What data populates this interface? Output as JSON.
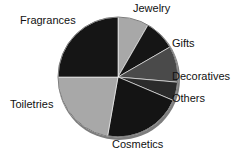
{
  "chart_data": {
    "type": "pie",
    "title": "",
    "categories": [
      "Jewelry",
      "Gifts",
      "Decoratives",
      "Others",
      "Cosmetics",
      "Toiletries",
      "Fragrances"
    ],
    "values": [
      8.3,
      8.3,
      9.7,
      5.0,
      21.4,
      22.2,
      25.0
    ],
    "unit": "percent",
    "start_angle_deg": 0,
    "direction": "clockwise",
    "legend": "none",
    "labels_position": "outside",
    "slices": [
      {
        "label": "Jewelry",
        "value": 8.3,
        "color": "#a8a8a8",
        "start_deg": 0,
        "end_deg": 30
      },
      {
        "label": "Gifts",
        "value": 8.3,
        "color": "#151515",
        "start_deg": 30,
        "end_deg": 60
      },
      {
        "label": "Decoratives",
        "value": 9.7,
        "color": "#4a4a4a",
        "start_deg": 60,
        "end_deg": 95
      },
      {
        "label": "Others",
        "value": 5.0,
        "color": "#2b2b2b",
        "start_deg": 95,
        "end_deg": 113
      },
      {
        "label": "Cosmetics",
        "value": 21.4,
        "color": "#141414",
        "start_deg": 113,
        "end_deg": 190
      },
      {
        "label": "Toiletries",
        "value": 22.2,
        "color": "#a8a8a8",
        "start_deg": 190,
        "end_deg": 270
      },
      {
        "label": "Fragrances",
        "value": 25.0,
        "color": "#151515",
        "start_deg": 270,
        "end_deg": 360
      }
    ],
    "geometry": {
      "center_x": 118,
      "center_y": 77,
      "radius": 60
    },
    "colors": {
      "light_gray": "#a8a8a8",
      "medium_gray": "#4a4a4a",
      "dark_gray": "#2b2b2b",
      "black": "#151515",
      "outline": "#7d7d7d",
      "background": "#ffffff",
      "label_text": "#111111"
    }
  },
  "labels": {
    "jewelry": "Jewelry",
    "fragrances": "Fragrances",
    "gifts": "Gifts",
    "decoratives": "Decoratives",
    "others": "Others",
    "toiletries": "Toiletries",
    "cosmetics": "Cosmetics"
  }
}
